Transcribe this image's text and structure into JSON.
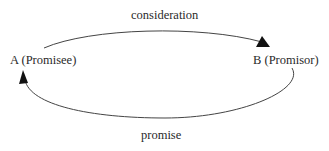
{
  "diagram": {
    "nodes": [
      {
        "id": "A",
        "label": "A (Promisee)"
      },
      {
        "id": "B",
        "label": "B (Promisor)"
      }
    ],
    "edges": [
      {
        "from": "A",
        "to": "B",
        "label": "consideration"
      },
      {
        "from": "B",
        "to": "A",
        "label": "promise"
      }
    ],
    "colors": {
      "line": "#333333",
      "arrowhead": "#111111",
      "background": "#ffffff"
    }
  }
}
